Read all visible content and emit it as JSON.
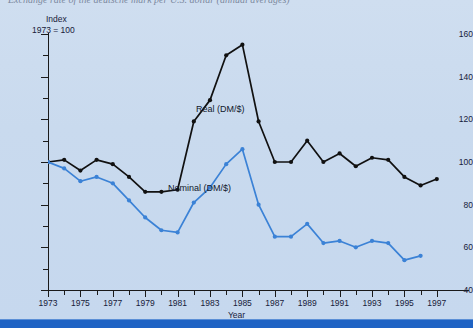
{
  "top_caption_fragment": "Exchange rate of the deutsche mark per U.S. dollar (annual averages)",
  "axis": {
    "y_title_line1": "Index",
    "y_title_line2": "1973 = 100",
    "x_title": "Year"
  },
  "legend": {
    "real_label": "Real (DM/$)",
    "nominal_label": "Nominal (DM/$)"
  },
  "colors": {
    "panel_background": "#ccdcf0",
    "real_series": "#111111",
    "nominal_series": "#3b82d6",
    "axis": "#1a1a1a",
    "bottom_bar": "#1f63c4",
    "text": "#17203a"
  },
  "chart_data": {
    "type": "line",
    "title": "",
    "xlabel": "Year",
    "ylabel": "Index 1973 = 100",
    "xlim": [
      1973,
      1997
    ],
    "ylim": [
      40,
      160
    ],
    "ytick_major": [
      40,
      60,
      80,
      100,
      120,
      140,
      160
    ],
    "ytick_minor": [
      50,
      70,
      90,
      110,
      130,
      150
    ],
    "ytick_labels": [
      "40",
      "60",
      "80",
      "100",
      "120",
      "140",
      "160"
    ],
    "xtick_labels": [
      "1973",
      "1975",
      "1977",
      "1979",
      "1981",
      "1983",
      "1985",
      "1987",
      "1989",
      "1991",
      "1993",
      "1995",
      "1997"
    ],
    "x": [
      1973,
      1974,
      1975,
      1976,
      1977,
      1978,
      1979,
      1980,
      1981,
      1982,
      1983,
      1984,
      1985,
      1986,
      1987,
      1988,
      1989,
      1990,
      1991,
      1992,
      1993,
      1994,
      1995,
      1996,
      1997
    ],
    "grid": false,
    "legend_position": "inline-annotation",
    "markers": "filled-circle",
    "series": [
      {
        "name": "Real (DM/$)",
        "color": "#111111",
        "values": [
          100,
          101,
          96,
          101,
          99,
          93,
          86,
          86,
          87,
          119,
          129,
          150,
          155,
          119,
          100,
          100,
          110,
          100,
          104,
          98,
          102,
          101,
          93,
          89,
          92
        ]
      },
      {
        "name": "Nominal (DM/$)",
        "color": "#3b82d6",
        "values": [
          100,
          97,
          91,
          93,
          90,
          82,
          74,
          68,
          67,
          81,
          88,
          99,
          106,
          80,
          65,
          65,
          71,
          62,
          63,
          60,
          63,
          62,
          54,
          56,
          null
        ]
      }
    ]
  }
}
